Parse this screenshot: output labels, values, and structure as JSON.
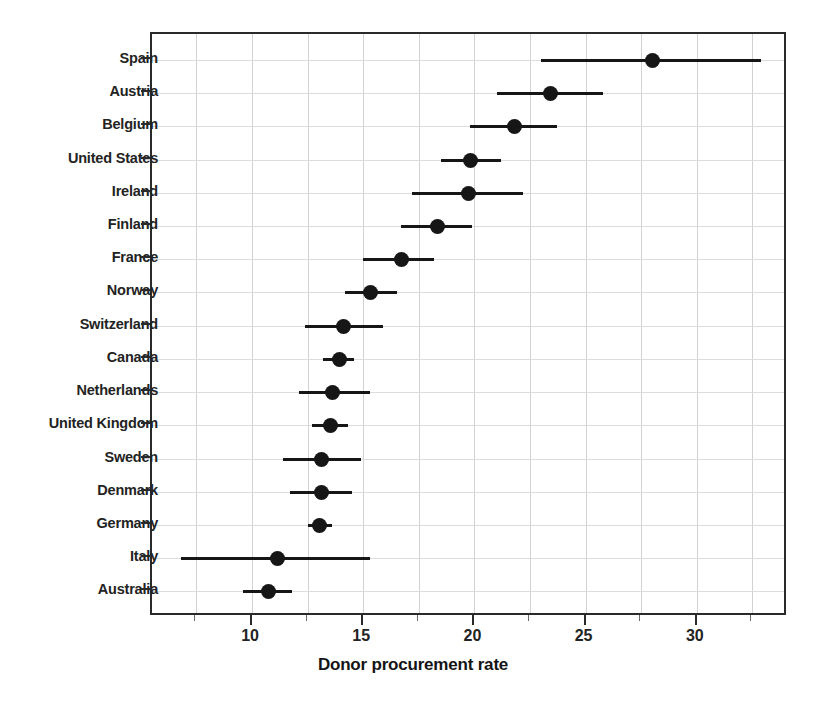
{
  "chart_data": {
    "type": "scatter",
    "title": "",
    "subtitle": "",
    "xlabel": "Donor procurement rate",
    "ylabel": "",
    "xlim": [
      5.5,
      34.1
    ],
    "ylim": [
      0,
      17
    ],
    "grid": true,
    "legend": null,
    "orientation": "horizontal",
    "plot_style": "dot-plot with confidence-interval whiskers",
    "xticks": [
      10,
      15,
      20,
      25,
      30
    ],
    "xtick_labels": [
      "10",
      "15",
      "20",
      "25",
      "30"
    ],
    "xminorticks": [
      7.5,
      12.5,
      17.5,
      22.5,
      27.5,
      32.5
    ],
    "gridline_interval": 2.5,
    "categories": [
      "Spain",
      "Austria",
      "Belgium",
      "United States",
      "Ireland",
      "Finland",
      "France",
      "Norway",
      "Switzerland",
      "Canada",
      "Netherlands",
      "United Kingdom",
      "Sweden",
      "Denmark",
      "Germany",
      "Italy",
      "Australia"
    ],
    "values": [
      28.0,
      23.4,
      21.8,
      19.8,
      19.7,
      18.3,
      16.7,
      15.3,
      14.1,
      13.9,
      13.6,
      13.5,
      13.1,
      13.1,
      13.0,
      11.1,
      10.7
    ],
    "ci_low": [
      23.0,
      21.0,
      19.8,
      18.5,
      17.2,
      16.7,
      15.0,
      14.2,
      12.4,
      13.2,
      12.1,
      12.7,
      11.4,
      11.7,
      12.5,
      6.8,
      9.6
    ],
    "ci_high": [
      32.9,
      25.8,
      23.7,
      21.2,
      22.2,
      19.9,
      18.2,
      16.5,
      15.9,
      14.6,
      15.3,
      14.3,
      14.9,
      14.5,
      13.6,
      15.3,
      11.8
    ],
    "points": [
      {
        "label": "Spain",
        "value": 28.0,
        "ci_low": 23.0,
        "ci_high": 32.9
      },
      {
        "label": "Austria",
        "value": 23.4,
        "ci_low": 21.0,
        "ci_high": 25.8
      },
      {
        "label": "Belgium",
        "value": 21.8,
        "ci_low": 19.8,
        "ci_high": 23.7
      },
      {
        "label": "United States",
        "value": 19.8,
        "ci_low": 18.5,
        "ci_high": 21.2
      },
      {
        "label": "Ireland",
        "value": 19.7,
        "ci_low": 17.2,
        "ci_high": 22.2
      },
      {
        "label": "Finland",
        "value": 18.3,
        "ci_low": 16.7,
        "ci_high": 19.9
      },
      {
        "label": "France",
        "value": 16.7,
        "ci_low": 15.0,
        "ci_high": 18.2
      },
      {
        "label": "Norway",
        "value": 15.3,
        "ci_low": 14.2,
        "ci_high": 16.5
      },
      {
        "label": "Switzerland",
        "value": 14.1,
        "ci_low": 12.4,
        "ci_high": 15.9
      },
      {
        "label": "Canada",
        "value": 13.9,
        "ci_low": 13.2,
        "ci_high": 14.6
      },
      {
        "label": "Netherlands",
        "value": 13.6,
        "ci_low": 12.1,
        "ci_high": 15.3
      },
      {
        "label": "United Kingdom",
        "value": 13.5,
        "ci_low": 12.7,
        "ci_high": 14.3
      },
      {
        "label": "Sweden",
        "value": 13.1,
        "ci_low": 11.4,
        "ci_high": 14.9
      },
      {
        "label": "Denmark",
        "value": 13.1,
        "ci_low": 11.7,
        "ci_high": 14.5
      },
      {
        "label": "Germany",
        "value": 13.0,
        "ci_low": 12.5,
        "ci_high": 13.6
      },
      {
        "label": "Italy",
        "value": 11.1,
        "ci_low": 6.8,
        "ci_high": 15.3
      },
      {
        "label": "Australia",
        "value": 10.7,
        "ci_low": 9.6,
        "ci_high": 11.8
      }
    ],
    "colors": {
      "marker": "#161616",
      "line": "#161616",
      "grid": "#d2d2d2",
      "frame": "#2a2a2a",
      "text": "#232323",
      "background": "#ffffff"
    }
  }
}
